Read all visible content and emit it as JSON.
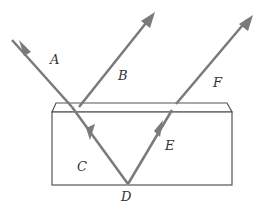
{
  "diagram": {
    "title": "",
    "colors": {
      "ray": "#7a7a7a",
      "block": "#555555",
      "label": "#333333"
    },
    "labels": {
      "A": "A",
      "B": "B",
      "C": "C",
      "D": "D",
      "E": "E",
      "F": "F"
    },
    "elements": [
      {
        "id": "A",
        "description": "incident ray entering top surface"
      },
      {
        "id": "B",
        "description": "ray reflected from top surface"
      },
      {
        "id": "C",
        "description": "refracted ray inside the block"
      },
      {
        "id": "D",
        "description": "point of reflection at bottom surface"
      },
      {
        "id": "E",
        "description": "ray reflected upward inside the block"
      },
      {
        "id": "F",
        "description": "ray emerging from top surface"
      }
    ]
  }
}
